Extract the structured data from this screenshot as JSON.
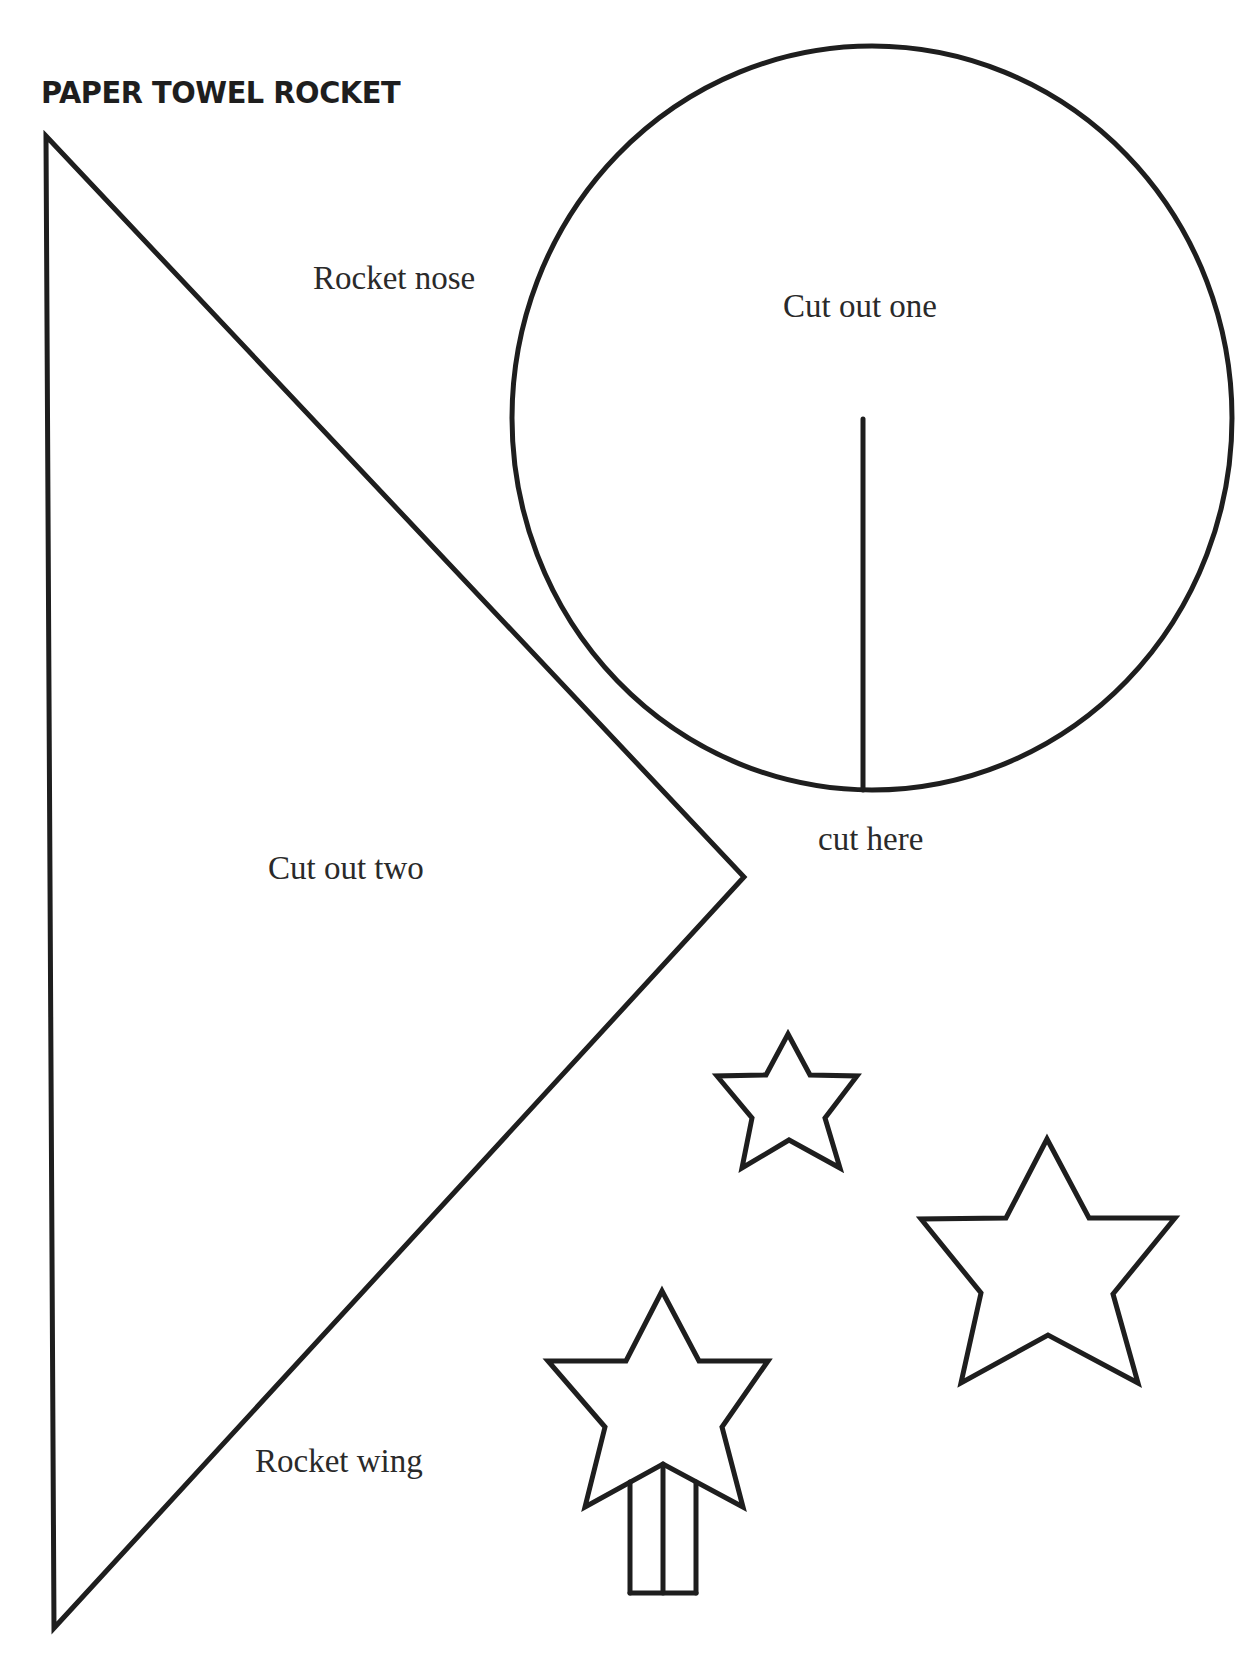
{
  "document": {
    "title": "PAPER TOWEL ROCKET",
    "background_color": "#ffffff",
    "ink_color": "#1e1e1e"
  },
  "pieces": {
    "nose": {
      "shape": "circle",
      "label": "Rocket nose",
      "instruction": "Cut out one",
      "cut_line_label": "cut here"
    },
    "wing": {
      "shape": "triangle",
      "label": "Rocket wing",
      "instruction": "Cut out two"
    },
    "decorations": [
      {
        "shape": "star",
        "size": "small"
      },
      {
        "shape": "star",
        "size": "large"
      },
      {
        "shape": "star-wand",
        "size": "medium"
      }
    ]
  }
}
